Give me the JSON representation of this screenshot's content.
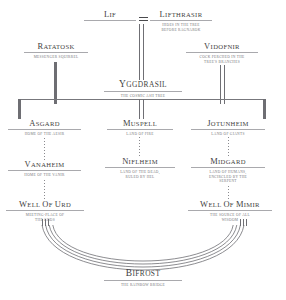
{
  "diagram": {
    "type": "tree",
    "theme_colors": {
      "ink": "#3f3f42",
      "subtext": "#76767a",
      "rule": "#a9a9ad",
      "connector": "#6f6f74",
      "background": "#ffffff"
    }
  },
  "nodes": {
    "lif": {
      "title": "Lif",
      "subtitle": ""
    },
    "lifthrasir": {
      "title": "Lifthrasir",
      "subtitle": "HIDES IN THE TREE\nBEFORE RAGNAROK"
    },
    "ratatosk": {
      "title": "Ratatosk",
      "subtitle": "MESSENGER SQUIRREL"
    },
    "vidofnir": {
      "title": "Vidofnir",
      "subtitle": "COCK PERCHED IN THE\nTREE'S BRANCHES"
    },
    "yggdrasil": {
      "title": "Yggdrasil",
      "subtitle": "THE COSMIC ASH TREE"
    },
    "asgard": {
      "title": "Asgard",
      "subtitle": "HOME OF THE AESIR"
    },
    "vanaheim": {
      "title": "Vanaheim",
      "subtitle": "HOME OF THE VANIR"
    },
    "well_of_urd": {
      "title": "Well of Urd",
      "subtitle": "MEETING-PLACE OF\nTHE GODS"
    },
    "muspell": {
      "title": "Muspell",
      "subtitle": "LAND OF FIRE"
    },
    "niflheim": {
      "title": "Niflheim",
      "subtitle": "LAND OF THE DEAD,\nRULED BY HEL"
    },
    "jotunheim": {
      "title": "Jotunheim",
      "subtitle": "LAND OF GIANTS"
    },
    "midgard": {
      "title": "Midgard",
      "subtitle": "LAND OF HUMANS,\nENCIRCLED BY THE\nSERPENT"
    },
    "well_of_mimir": {
      "title": "Well of Mimir",
      "subtitle": "THE SOURCE OF ALL\nWISDOM"
    },
    "bifrost": {
      "title": "Bifrost",
      "subtitle": "THE RAINBOW BRIDGE"
    }
  },
  "relations": {
    "marriage_symbol": "=",
    "edges": [
      "lif = lifthrasir",
      "lifthrasir -> yggdrasil",
      "ratatosk -> yggdrasil",
      "vidofnir -> yggdrasil",
      "yggdrasil -> asgard",
      "yggdrasil -> muspell",
      "yggdrasil -> jotunheim",
      "asgard -> vanaheim",
      "vanaheim -> well_of_urd",
      "muspell -> niflheim",
      "jotunheim -> midgard",
      "midgard -> well_of_mimir",
      "well_of_urd -> bifrost",
      "well_of_mimir -> bifrost"
    ]
  }
}
